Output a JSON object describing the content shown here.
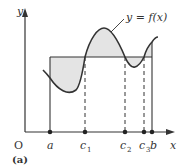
{
  "figure": {
    "caption": "(a)",
    "origin_label": "O",
    "x_axis_label": "x",
    "y_axis_label": "y",
    "curve_label": "y = f(x)",
    "points": [
      {
        "label": "a",
        "sub": "",
        "x": 50
      },
      {
        "label": "c",
        "sub": "1",
        "x": 85
      },
      {
        "label": "c",
        "sub": "2",
        "x": 125
      },
      {
        "label": "c",
        "sub": "3",
        "x": 144
      },
      {
        "label": "b",
        "sub": "",
        "x": 152
      }
    ],
    "colors": {
      "line": "#333333",
      "shade": "#e4e4e4"
    }
  }
}
